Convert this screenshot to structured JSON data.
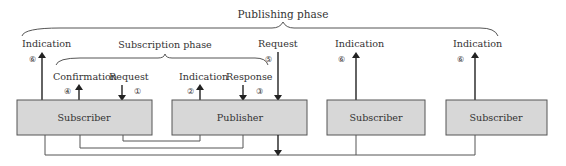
{
  "diagram": {
    "colors": {
      "box_fill": "#d7d7d7",
      "box_stroke": "#555555",
      "line": "#555555",
      "arrow": "#222222",
      "text": "#333333"
    },
    "phases": {
      "publishing": "Publishing phase",
      "subscription": "Subscription phase"
    },
    "nodes": [
      {
        "id": "subscriber-1",
        "label": "Subscriber"
      },
      {
        "id": "publisher",
        "label": "Publisher"
      },
      {
        "id": "subscriber-2",
        "label": "Subscriber"
      },
      {
        "id": "subscriber-3",
        "label": "Subscriber"
      }
    ],
    "messages": [
      {
        "step": "①",
        "label": "Request",
        "from": "subscriber-1",
        "direction": "down"
      },
      {
        "step": "②",
        "label": "Indication",
        "at": "publisher",
        "direction": "up"
      },
      {
        "step": "③",
        "label": "Response",
        "to": "publisher",
        "direction": "down"
      },
      {
        "step": "④",
        "label": "Confirmation",
        "at": "subscriber-1",
        "direction": "up"
      },
      {
        "step": "⑤",
        "label": "Request",
        "at": "publisher",
        "direction": "down"
      },
      {
        "step": "⑥",
        "label": "Indication",
        "at": "subscriber-1",
        "direction": "up"
      },
      {
        "step": "⑥",
        "label": "Indication",
        "at": "subscriber-2",
        "direction": "up"
      },
      {
        "step": "⑥",
        "label": "Indication",
        "at": "subscriber-3",
        "direction": "up"
      }
    ]
  }
}
